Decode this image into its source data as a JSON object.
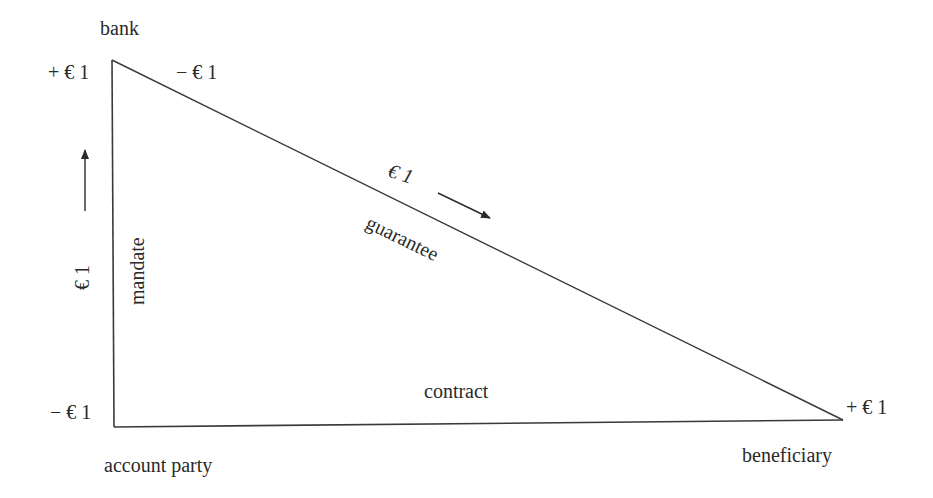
{
  "diagram": {
    "nodes": {
      "bank": "bank",
      "account_party": "account party",
      "beneficiary": "beneficiary"
    },
    "edges": {
      "mandate": "mandate",
      "guarantee": "guarantee",
      "contract": "contract"
    },
    "amounts": {
      "bank_left": "+ € 1",
      "bank_right": "− € 1",
      "account_party": "− € 1",
      "beneficiary": "+ € 1",
      "mandate_flow": "€ 1",
      "guarantee_flow": "€ 1"
    },
    "flows": [
      {
        "from": "account party",
        "to": "bank",
        "via": "mandate",
        "amount": "€ 1"
      },
      {
        "from": "bank",
        "to": "beneficiary",
        "via": "guarantee",
        "amount": "€ 1"
      }
    ],
    "colors": {
      "line": "#3a3a3a",
      "text": "#2a2a2a",
      "background": "#ffffff"
    }
  }
}
